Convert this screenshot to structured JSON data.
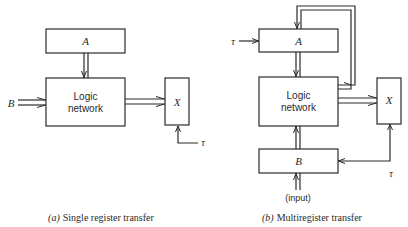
{
  "diagrams": [
    {
      "id": "a",
      "caption_prefix": "(a)",
      "caption": "Single register transfer",
      "blocks": {
        "register_a": "A",
        "logic_line1": "Logic",
        "logic_line2": "network",
        "register_x": "X"
      },
      "inputs": {
        "b_label": "B",
        "clock_label": "τ"
      }
    },
    {
      "id": "b",
      "caption_prefix": "(b)",
      "caption": "Multiregister transfer",
      "blocks": {
        "register_a": "A",
        "logic_line1": "Logic",
        "logic_line2": "network",
        "register_x": "X",
        "register_b": "B"
      },
      "inputs": {
        "clock_a_label": "τ",
        "clock_bx_label": "τ",
        "input_label": "(input)"
      }
    }
  ],
  "colors": {
    "ink": "#2a2a2a",
    "background": "#ffffff"
  }
}
